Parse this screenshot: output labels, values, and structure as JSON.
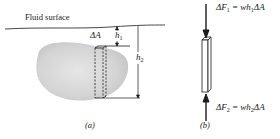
{
  "figure": {
    "panel_a": {
      "surface_label": "Fluid surface",
      "area_label": "ΔA",
      "depth1_label": "h",
      "depth1_sub": "1",
      "depth2_label": "h",
      "depth2_sub": "2",
      "caption": "(a)"
    },
    "panel_b": {
      "force1_label": "ΔF",
      "force1_sub": "1",
      "force1_eq": " = wh",
      "force1_eq_sub": "1",
      "force1_tail": "ΔA",
      "force2_label": "ΔF",
      "force2_sub": "2",
      "force2_eq": " = wh",
      "force2_eq_sub": "2",
      "force2_tail": "ΔA",
      "caption": "(b)"
    },
    "colors": {
      "line": "#1a1a1a",
      "body_fill": "#d9d9d9",
      "background": "#ffffff"
    }
  }
}
